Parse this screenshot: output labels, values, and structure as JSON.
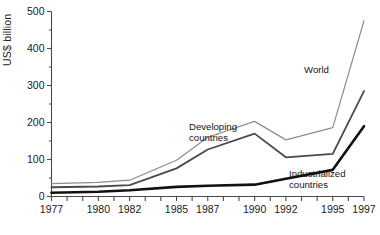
{
  "chart_data": {
    "type": "line",
    "title": "",
    "xlabel": "",
    "ylabel": "US$ billion",
    "xlim": [
      1977,
      1997
    ],
    "ylim": [
      0,
      500
    ],
    "grid": false,
    "legend_position": "inline-annotations",
    "y_ticks": [
      0,
      100,
      200,
      300,
      400,
      500
    ],
    "y_minor_ticks": [
      50,
      150,
      250,
      350,
      450
    ],
    "x_ticks": [
      1977,
      1978,
      1979,
      1980,
      1981,
      1982,
      1983,
      1984,
      1985,
      1986,
      1987,
      1988,
      1989,
      1990,
      1991,
      1992,
      1993,
      1994,
      1995,
      1996,
      1997
    ],
    "x_tick_labels": [
      "1977",
      "",
      "",
      "1980",
      "",
      "1982",
      "",
      "",
      "1985",
      "",
      "1987",
      "",
      "",
      "1990",
      "",
      "1992",
      "",
      "",
      "1995",
      "",
      "1997"
    ],
    "x": [
      1977,
      1980,
      1982,
      1985,
      1987,
      1990,
      1992,
      1995,
      1997
    ],
    "series": [
      {
        "name": "World",
        "color": "#8c8c8c",
        "width": 1.2,
        "values": [
          35,
          38,
          44,
          98,
          160,
          203,
          153,
          186,
          475
        ]
      },
      {
        "name": "Developing countries",
        "color": "#4a4a4a",
        "width": 1.8,
        "values": [
          25,
          27,
          31,
          76,
          127,
          170,
          106,
          115,
          285
        ]
      },
      {
        "name": "Industrialized countries",
        "color": "#111111",
        "width": 2.6,
        "values": [
          10,
          13,
          17,
          26,
          29,
          32,
          48,
          72,
          190
        ]
      }
    ],
    "annotations": [
      {
        "text": "World",
        "series": "World",
        "x": 1994,
        "y": 330
      },
      {
        "text_line1": "Developing",
        "text_line2": "countries",
        "series": "Developing countries",
        "x": 1989,
        "y": 130
      },
      {
        "text_line1": "Industrialized",
        "text_line2": "countries",
        "series": "Industrialized countries",
        "x": 1994,
        "y": 58
      }
    ]
  },
  "axis": {
    "y_label": "US$ billion",
    "y_tick_labels": [
      "500",
      "400",
      "300",
      "200",
      "100",
      "0"
    ],
    "x_tick_labels_visible": [
      "1977",
      "1980",
      "1982",
      "1985",
      "1987",
      "1990",
      "1992",
      "1995",
      "1997"
    ]
  },
  "annotations": {
    "world": "World",
    "developing_line1": "Developing",
    "developing_line2": "countries",
    "industrialized_line1": "Industrialized",
    "industrialized_line2": "countries"
  },
  "colors": {
    "axis": "#4a4a4a",
    "text": "#1a1a1a",
    "world": "#8c8c8c",
    "developing": "#4a4a4a",
    "industrialized": "#111111",
    "background": "#ffffff"
  }
}
